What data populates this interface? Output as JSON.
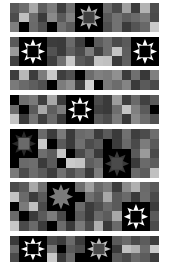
{
  "image": {
    "description": "Seven horizontal quilt strips of gray squares with eight-point star blocks",
    "width": 169,
    "height": 262,
    "background": "#ffffff",
    "columns": 16
  },
  "strips": [
    {
      "top": 3,
      "height": 29,
      "rows": 3,
      "cells": [
        [
          "#5a5a5a",
          "#6e6e6e",
          "#a8a8a8",
          "#5e5e5e",
          "#7c7c7c",
          "#3e3e3e",
          "#707070",
          "#000000",
          "#000000",
          "#000000",
          "#6a6a6a",
          "#4a4a4a",
          "#a0a0a0",
          "#3c3c3c",
          "#b4b4b4",
          "#4e4e4e"
        ],
        [
          "#4c4c4c",
          "#c0c0c0",
          "#6c6c6c",
          "#3a3a3a",
          "#8a8a8a",
          "#5a5a5a",
          "#808080",
          "#000000",
          "#000000",
          "#000000",
          "#585858",
          "#727272",
          "#5e5e5e",
          "#6a6a6a",
          "#7a7a7a",
          "#4a4a4a"
        ],
        [
          "#7e7e7e",
          "#000000",
          "#6a6a6a",
          "#505050",
          "#000000",
          "#707070",
          "#5c5c5c",
          "#000000",
          "#000000",
          "#000000",
          "#4e4e4e",
          "#727272",
          "#3a3a3a",
          "#545454",
          "#686868",
          "#cacaca"
        ]
      ],
      "stars": [
        {
          "col": 7,
          "row": 0,
          "size": 3,
          "points": "#b0b0b0",
          "center": "#404040",
          "bg": "#000000"
        }
      ]
    },
    {
      "top": 37,
      "height": 29,
      "rows": 3,
      "cells": [
        [
          "#5a5a5a",
          "#000000",
          "#000000",
          "#000000",
          "#3c3c3c",
          "#3a3a3a",
          "#6a6a6a",
          "#3e3e3e",
          "#000000",
          "#5c5c5c",
          "#6e6e6e",
          "#4a4a4a",
          "#5a5a5a",
          "#000000",
          "#000000",
          "#000000"
        ],
        [
          "#9a9a9a",
          "#000000",
          "#000000",
          "#000000",
          "#525252",
          "#3a3a3a",
          "#606060",
          "#4a4a4a",
          "#7c7c7c",
          "#404040",
          "#6e6e6e",
          "#c4c4c4",
          "#5e5e5e",
          "#000000",
          "#000000",
          "#000000"
        ],
        [
          "#404040",
          "#000000",
          "#000000",
          "#000000",
          "#3e3e3e",
          "#707070",
          "#c8c8c8",
          "#5a5a5a",
          "#4c4c4c",
          "#c4c4c4",
          "#c0c0c0",
          "#3a3a3a",
          "#606060",
          "#000000",
          "#000000",
          "#000000"
        ]
      ],
      "stars": [
        {
          "col": 1,
          "row": 0,
          "size": 3,
          "points": "#ffffff",
          "center": "#000000",
          "bg": "#000000"
        },
        {
          "col": 13,
          "row": 0,
          "size": 3,
          "points": "#ffffff",
          "center": "#000000",
          "bg": "#000000"
        }
      ]
    },
    {
      "top": 70,
      "height": 20,
      "rows": 2,
      "cells": [
        [
          "#3e3e3e",
          "#b8b8b8",
          "#3c3c3c",
          "#7c7c7c",
          "#c8c8c8",
          "#3e3e3e",
          "#505050",
          "#000000",
          "#6c6c6c",
          "#808080",
          "#7a7a7a",
          "#909090",
          "#3c3c3c",
          "#707070",
          "#383838",
          "#808080"
        ],
        [
          "#7a7a7a",
          "#6a6a6a",
          "#5e5e5e",
          "#505050",
          "#000000",
          "#7c7c7c",
          "#8e8e8e",
          "#3c3c3c",
          "#d0d0d0",
          "#000000",
          "#7a7a7a",
          "#6c6c6c",
          "#848484",
          "#3a3a3a",
          "#5a5a5a",
          "#4a4a4a"
        ]
      ],
      "stars": []
    },
    {
      "top": 95,
      "height": 29,
      "rows": 3,
      "cells": [
        [
          "#000000",
          "#6e6e6e",
          "#7a7a7a",
          "#3e3e3e",
          "#a8a8a8",
          "#3a3a3a",
          "#000000",
          "#000000",
          "#000000",
          "#4a4a4a",
          "#3a3a3a",
          "#9c9c9c",
          "#3e3e3e",
          "#6a6a6a",
          "#404040",
          "#5a5a5a"
        ],
        [
          "#6c6c6c",
          "#000000",
          "#5a5a5a",
          "#a8a8a8",
          "#5e5e5e",
          "#7c7c7c",
          "#000000",
          "#000000",
          "#000000",
          "#404040",
          "#3a3a3a",
          "#6e6e6e",
          "#c4c4c4",
          "#808080",
          "#5a5a5a",
          "#000000"
        ],
        [
          "#c4c4c4",
          "#3a3a3a",
          "#747474",
          "#3e3e3e",
          "#6a6a6a",
          "#3a3a3a",
          "#000000",
          "#000000",
          "#000000",
          "#5a5a5a",
          "#4c4c4c",
          "#7c7c7c",
          "#383838",
          "#8a8a8a",
          "#6c6c6c",
          "#505050"
        ]
      ],
      "stars": [
        {
          "col": 6,
          "row": 0,
          "size": 3,
          "points": "#ffffff",
          "center": "#000000",
          "bg": "#000000"
        }
      ]
    },
    {
      "top": 129,
      "height": 49,
      "rows": 5,
      "cells": [
        [
          "#000000",
          "#000000",
          "#000000",
          "#6a6a6a",
          "#3c3c3c",
          "#7a7a7a",
          "#3a3a3a",
          "#6a6a6a",
          "#707070",
          "#3c3c3c",
          "#5a5a5a",
          "#3a3a3a",
          "#707070",
          "#3e3e3e",
          "#4c4c4c",
          "#6e6e6e"
        ],
        [
          "#000000",
          "#000000",
          "#000000",
          "#c8c8c8",
          "#000000",
          "#5a5a5a",
          "#3a3a3a",
          "#707070",
          "#4c4c4c",
          "#5a5a5a",
          "#000000",
          "#3c3c3c",
          "#6a6a6a",
          "#4a4a4a",
          "#7c7c7c",
          "#5a5a5a"
        ],
        [
          "#000000",
          "#000000",
          "#000000",
          "#6e6e6e",
          "#5c5c5c",
          "#c4c4c4",
          "#000000",
          "#4a4a4a",
          "#6a6a6a",
          "#3a3a3a",
          "#000000",
          "#000000",
          "#000000",
          "#5a5a5a",
          "#9a9a9a",
          "#4a4a4a"
        ],
        [
          "#000000",
          "#6a6a6a",
          "#6e6e6e",
          "#3a3a3a",
          "#5a5a5a",
          "#000000",
          "#cacaca",
          "#c4c4c4",
          "#5e5e5e",
          "#6c6c6c",
          "#000000",
          "#000000",
          "#000000",
          "#3a3a3a",
          "#6a6a6a",
          "#5c5c5c"
        ],
        [
          "#7a7a7a",
          "#4a4a4a",
          "#6c6c6c",
          "#5a5a5a",
          "#3c3c3c",
          "#707070",
          "#4e4e4e",
          "#6a6a6a",
          "#3a3a3a",
          "#7c7c7c",
          "#000000",
          "#000000",
          "#000000",
          "#6a6a6a",
          "#5c5c5c",
          "#c0c0c0"
        ]
      ],
      "stars": [
        {
          "col": 0,
          "row": 0,
          "size": 3,
          "points": "#2a2a2a",
          "center": "#6a6a6a",
          "bg": "#000000"
        },
        {
          "col": 10,
          "row": 2,
          "size": 3,
          "points": "#3a3a3a",
          "center": "#4a4a4a",
          "bg": "#000000"
        }
      ]
    },
    {
      "top": 182,
      "height": 49,
      "rows": 5,
      "cells": [
        [
          "#4a4a4a",
          "#5a5a5a",
          "#a8a8a8",
          "#707070",
          "#000000",
          "#000000",
          "#000000",
          "#6e6e6e",
          "#a0a0a0",
          "#6a6a6a",
          "#7c7c7c",
          "#3c3c3c",
          "#8a8a8a",
          "#b0b0b0",
          "#6a6a6a",
          "#5a5a5a"
        ],
        [
          "#c4c4c4",
          "#6a6a6a",
          "#3c3c3c",
          "#5a5a5a",
          "#000000",
          "#000000",
          "#000000",
          "#000000",
          "#707070",
          "#5c5c5c",
          "#a8a8a8",
          "#5a5a5a",
          "#6a6a6a",
          "#3a3a3a",
          "#6c6c6c",
          "#4a4a4a"
        ],
        [
          "#000000",
          "#7a7a7a",
          "#c0c0c0",
          "#4a4a4a",
          "#000000",
          "#000000",
          "#000000",
          "#6a6a6a",
          "#3c3c3c",
          "#4e4e4e",
          "#6a6a6a",
          "#5a5a5a",
          "#000000",
          "#000000",
          "#000000",
          "#3c3c3c"
        ],
        [
          "#6a6a6a",
          "#000000",
          "#3a3a3a",
          "#5a5a5a",
          "#7c7c7c",
          "#4a4a4a",
          "#000000",
          "#5c5c5c",
          "#3a3a3a",
          "#6a6a6a",
          "#5c5c5c",
          "#a8a8a8",
          "#000000",
          "#000000",
          "#000000",
          "#5a5a5a"
        ],
        [
          "#c8c8c8",
          "#4a4a4a",
          "#6a6a6a",
          "#3c3c3c",
          "#000000",
          "#6c6c6c",
          "#3a3a3a",
          "#7a7a7a",
          "#4c4c4c",
          "#b0b0b0",
          "#3a3a3a",
          "#6a6a6a",
          "#000000",
          "#000000",
          "#000000",
          "#4a4a4a"
        ]
      ],
      "stars": [
        {
          "col": 4,
          "row": 0,
          "size": 3,
          "points": "#7c7c7c",
          "center": "#7a7a7a",
          "bg": "#000000"
        },
        {
          "col": 12,
          "row": 2,
          "size": 3,
          "points": "#ffffff",
          "center": "#000000",
          "bg": "#000000"
        }
      ]
    },
    {
      "top": 236,
      "height": 26,
      "rows": 3,
      "cells": [
        [
          "#3a3a3a",
          "#000000",
          "#000000",
          "#000000",
          "#4a4a4a",
          "#3c3c3c",
          "#6a6a6a",
          "#3a3a3a",
          "#000000",
          "#000000",
          "#000000",
          "#5a5a5a",
          "#6a6a6a",
          "#4a4a4a",
          "#5c5c5c",
          "#3c3c3c"
        ],
        [
          "#6a6a6a",
          "#000000",
          "#000000",
          "#000000",
          "#7a7a7a",
          "#000000",
          "#5a5a5a",
          "#4c4c4c",
          "#000000",
          "#000000",
          "#000000",
          "#3a3a3a",
          "#c0c0c0",
          "#b0b0b0",
          "#6a6a6a",
          "#c8c8c8"
        ],
        [
          "#4a4a4a",
          "#000000",
          "#000000",
          "#000000",
          "#c8c8c8",
          "#3a3a3a",
          "#6a6a6a",
          "#000000",
          "#000000",
          "#000000",
          "#000000",
          "#5a5a5a",
          "#4a4a4a",
          "#6a6a6a",
          "#5c5c5c",
          "#3c3c3c"
        ]
      ],
      "stars": [
        {
          "col": 1,
          "row": 0,
          "size": 3,
          "points": "#ffffff",
          "center": "#000000",
          "bg": "#000000"
        },
        {
          "col": 8,
          "row": 0,
          "size": 3,
          "points": "#c0c0c0",
          "center": "#4a4a4a",
          "bg": "#000000"
        }
      ]
    }
  ]
}
